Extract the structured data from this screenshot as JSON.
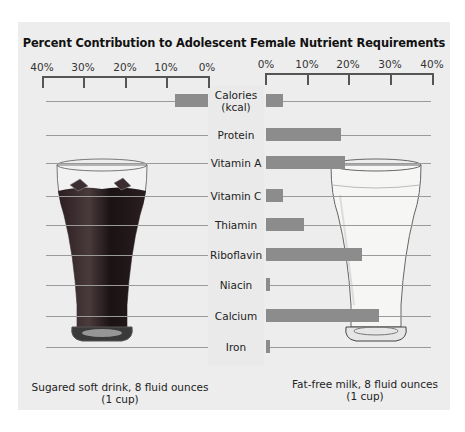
{
  "chart_data": {
    "type": "bar",
    "orientation": "horizontal",
    "layout": "back-to-back (butterfly)",
    "title": "Percent Contribution to Adolescent Female Nutrient Requirements",
    "xlabel": "Percent of requirement",
    "ylabel": "",
    "xlim": [
      0,
      40
    ],
    "categories": [
      "Calories (kcal)",
      "Protein",
      "Vitamin A",
      "Vitamin C",
      "Thiamin",
      "Riboflavin",
      "Niacin",
      "Calcium",
      "Iron"
    ],
    "left_axis_ticks": [
      "40%",
      "30%",
      "20%",
      "10%",
      "0%"
    ],
    "right_axis_ticks": [
      "0%",
      "10%",
      "20%",
      "30%",
      "40%"
    ],
    "grid": false,
    "series": [
      {
        "name": "Sugared soft drink, 8 fluid ounces (1 cup)",
        "side": "left",
        "values": [
          8,
          0,
          0,
          0,
          0,
          0,
          0,
          0,
          0
        ]
      },
      {
        "name": "Fat-free milk, 8 fluid ounces (1 cup)",
        "side": "right",
        "values": [
          4,
          18,
          19,
          4,
          9,
          23,
          1,
          27,
          1
        ]
      }
    ]
  },
  "title": "Percent Contribution to Adolescent Female Nutrient Requirements",
  "left_axis": {
    "ticks": [
      "40%",
      "30%",
      "20%",
      "10%",
      "0%"
    ]
  },
  "right_axis": {
    "ticks": [
      "0%",
      "10%",
      "20%",
      "30%",
      "40%"
    ]
  },
  "rows": [
    {
      "label_line1": "Calories",
      "label_line2": "(kcal)"
    },
    {
      "label_line1": "Protein",
      "label_line2": ""
    },
    {
      "label_line1": "Vitamin A",
      "label_line2": ""
    },
    {
      "label_line1": "Vitamin C",
      "label_line2": ""
    },
    {
      "label_line1": "Thiamin",
      "label_line2": ""
    },
    {
      "label_line1": "Riboflavin",
      "label_line2": ""
    },
    {
      "label_line1": "Niacin",
      "label_line2": ""
    },
    {
      "label_line1": "Calcium",
      "label_line2": ""
    },
    {
      "label_line1": "Iron",
      "label_line2": ""
    }
  ],
  "captions": {
    "left_line1": "Sugared soft drink, 8 fluid ounces",
    "left_line2": "(1 cup)",
    "right_line1": "Fat-free milk, 8 fluid ounces",
    "right_line2": "(1 cup)"
  },
  "illustrations": {
    "left": "soft-drink-glass",
    "right": "milk-glass"
  },
  "colors": {
    "panel_bg": "#ededed",
    "bar": "#8c8c8c",
    "axis": "#555555",
    "soft_drink": "#1c1416",
    "milk": "#f4f4f2"
  }
}
